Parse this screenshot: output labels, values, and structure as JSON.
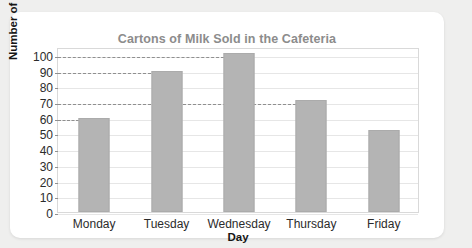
{
  "chart_data": {
    "type": "bar",
    "title": "Cartons of Milk Sold in the Cafeteria",
    "xlabel": "Day",
    "ylabel": "Number of Cartons",
    "categories": [
      "Monday",
      "Tuesday",
      "Wednesday",
      "Thursday",
      "Friday"
    ],
    "values": [
      60,
      90,
      101,
      71,
      52
    ],
    "ylim": [
      0,
      105
    ],
    "yticks": [
      0,
      10,
      20,
      30,
      40,
      50,
      60,
      70,
      80,
      90,
      100
    ],
    "ytick_labels": [
      "0",
      "10",
      "20",
      "30",
      "40",
      "50",
      "60",
      "70",
      "80",
      "90",
      "100"
    ],
    "grid": true,
    "legend": false,
    "series": [
      {
        "name": "Cartons of Milk Sold",
        "values": [
          60,
          90,
          101,
          71,
          52
        ]
      }
    ],
    "annotations": [
      {
        "kind": "dashed-leader-line",
        "value": 100,
        "to_category": "Wednesday"
      },
      {
        "kind": "dashed-leader-line",
        "value": 90,
        "to_category": "Tuesday"
      },
      {
        "kind": "dashed-leader-line",
        "value": 70,
        "to_category": "Thursday"
      },
      {
        "kind": "dashed-leader-line",
        "value": 60,
        "to_category": "Monday"
      }
    ],
    "colors": {
      "bar_fill": "#b4b4b4",
      "bar_border": "#ababab",
      "title": "#8c8c8c",
      "axis_text": "#2b2b2b",
      "gridline": "#e6e6e6",
      "plot_border": "#d9d9d9",
      "leader_line": "#8f8f8f",
      "card_background": "#ffffff",
      "page_background": "#efefee"
    }
  }
}
